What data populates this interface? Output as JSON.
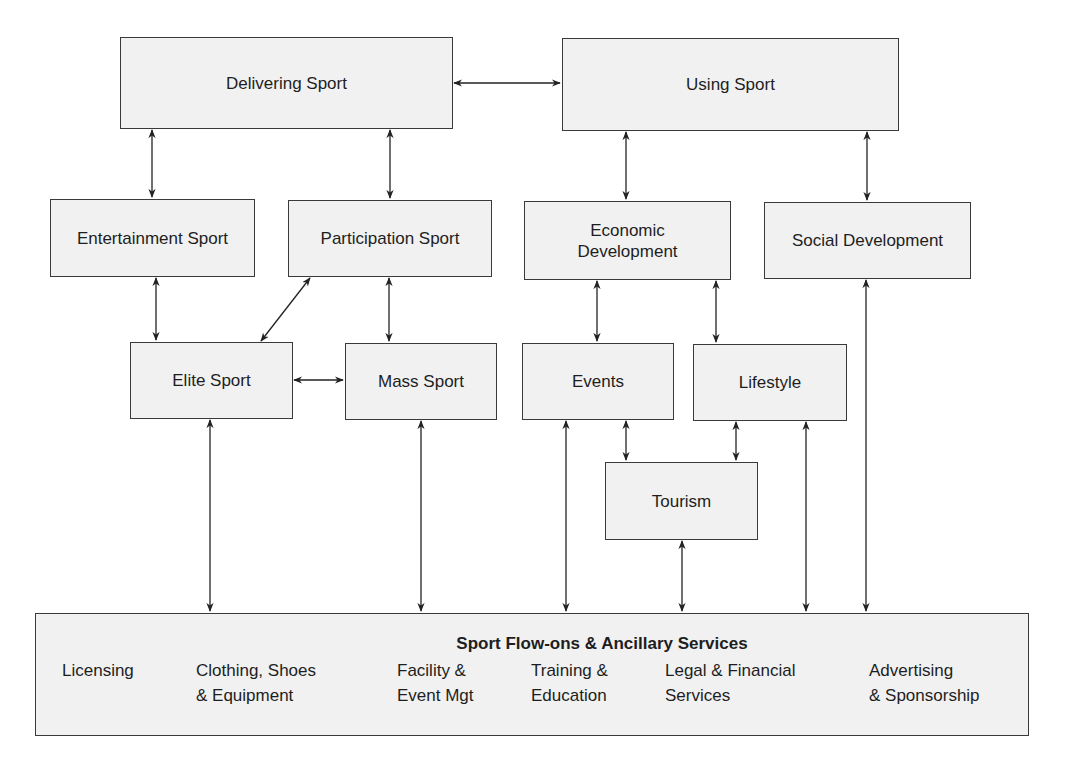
{
  "diagram": {
    "nodes": {
      "delivering_sport": "Delivering Sport",
      "using_sport": "Using Sport",
      "entertainment_sport": "Entertainment Sport",
      "participation_sport": "Participation Sport",
      "economic_development": "Economic\nDevelopment",
      "social_development": "Social Development",
      "elite_sport": "Elite Sport",
      "mass_sport": "Mass Sport",
      "events": "Events",
      "lifestyle": "Lifestyle",
      "tourism": "Tourism"
    },
    "ancillary": {
      "title": "Sport Flow-ons & Ancillary Services",
      "items": [
        "Licensing",
        "Clothing, Shoes\n& Equipment",
        "Facility &\nEvent Mgt",
        "Training &\nEducation",
        "Legal & Financial\nServices",
        "Advertising\n& Sponsorship"
      ]
    },
    "edges": [
      [
        "Delivering Sport",
        "Using Sport"
      ],
      [
        "Delivering Sport",
        "Entertainment Sport"
      ],
      [
        "Delivering Sport",
        "Participation Sport"
      ],
      [
        "Using Sport",
        "Economic Development"
      ],
      [
        "Using Sport",
        "Social Development"
      ],
      [
        "Entertainment Sport",
        "Elite Sport"
      ],
      [
        "Participation Sport",
        "Elite Sport"
      ],
      [
        "Participation Sport",
        "Mass Sport"
      ],
      [
        "Elite Sport",
        "Mass Sport"
      ],
      [
        "Economic Development",
        "Events"
      ],
      [
        "Economic Development",
        "Lifestyle"
      ],
      [
        "Events",
        "Tourism"
      ],
      [
        "Lifestyle",
        "Tourism"
      ],
      [
        "Elite Sport",
        "Sport Flow-ons & Ancillary Services"
      ],
      [
        "Mass Sport",
        "Sport Flow-ons & Ancillary Services"
      ],
      [
        "Events",
        "Sport Flow-ons & Ancillary Services"
      ],
      [
        "Tourism",
        "Sport Flow-ons & Ancillary Services"
      ],
      [
        "Lifestyle",
        "Sport Flow-ons & Ancillary Services"
      ],
      [
        "Social Development",
        "Sport Flow-ons & Ancillary Services"
      ]
    ]
  }
}
